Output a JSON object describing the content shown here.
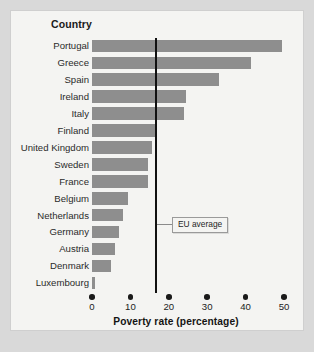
{
  "panel": {
    "category_header": "Country",
    "x_axis_title": "Poverty rate (percentage)",
    "annotation_label": "EU average"
  },
  "colors": {
    "bar": "#8e8e8e",
    "average_line": "#111111",
    "panel_background": "#f4f4f2",
    "page_background": "#d9d9d9",
    "text": "#222222"
  },
  "chart_data": {
    "type": "bar",
    "orientation": "horizontal",
    "title": "",
    "xlabel": "Poverty rate (percentage)",
    "ylabel": "Country",
    "xlim": [
      0,
      50
    ],
    "xticks": [
      0,
      10,
      20,
      30,
      40,
      50
    ],
    "xtick_labels": [
      "0",
      "10",
      "20",
      "30",
      "40",
      "50"
    ],
    "grid": false,
    "legend": false,
    "categories": [
      "Portugal",
      "Greece",
      "Spain",
      "Ireland",
      "Italy",
      "Finland",
      "United Kingdom",
      "Sweden",
      "France",
      "Belgium",
      "Netherlands",
      "Germany",
      "Austria",
      "Denmark",
      "Luxembourg"
    ],
    "values": [
      49.5,
      41.5,
      33,
      24.5,
      24,
      17,
      15.5,
      14.5,
      14.5,
      9.5,
      8,
      7,
      6,
      5,
      0.8
    ],
    "annotations": [
      {
        "label": "EU average",
        "type": "vline",
        "value": 16.4
      }
    ]
  }
}
